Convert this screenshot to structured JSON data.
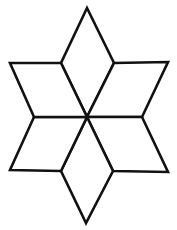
{
  "figure": {
    "caption": "",
    "type": "line-drawing",
    "background_color": "#ffffff",
    "stroke_color": "#111111",
    "fill_color": "#ffffff",
    "stroke_width": 2.6,
    "canvas": {
      "width": 177,
      "height": 230
    },
    "center_point": {
      "x": 87,
      "y": 117
    },
    "outer_tips": [
      {
        "name": "top",
        "x": 87,
        "y": 8
      },
      {
        "name": "upper-right",
        "x": 168,
        "y": 62
      },
      {
        "name": "lower-right",
        "x": 168,
        "y": 172
      },
      {
        "name": "bottom",
        "x": 86,
        "y": 223
      },
      {
        "name": "lower-left",
        "x": 10,
        "y": 170
      },
      {
        "name": "upper-left",
        "x": 10,
        "y": 63
      }
    ],
    "inner_hexagon_vertices": [
      {
        "name": "upper-left",
        "x": 61,
        "y": 63
      },
      {
        "name": "upper-right",
        "x": 114,
        "y": 63
      },
      {
        "name": "right",
        "x": 142,
        "y": 117
      },
      {
        "name": "lower-right",
        "x": 113,
        "y": 171
      },
      {
        "name": "lower-left",
        "x": 61,
        "y": 171
      },
      {
        "name": "left",
        "x": 34,
        "y": 117
      }
    ],
    "rhombi": [
      {
        "name": "rhombus-top",
        "points": "87,8 114,63 87,117 61,63"
      },
      {
        "name": "rhombus-upper-right",
        "points": "114,63 168,62 142,117 87,117"
      },
      {
        "name": "rhombus-lower-right",
        "points": "142,117 168,172 113,171 87,117"
      },
      {
        "name": "rhombus-bottom",
        "points": "87,117 113,171 86,223 61,171"
      },
      {
        "name": "rhombus-lower-left",
        "points": "34,117 87,117 61,171 10,170"
      },
      {
        "name": "rhombus-upper-left",
        "points": "10,63 61,63 87,117 34,117"
      }
    ]
  }
}
